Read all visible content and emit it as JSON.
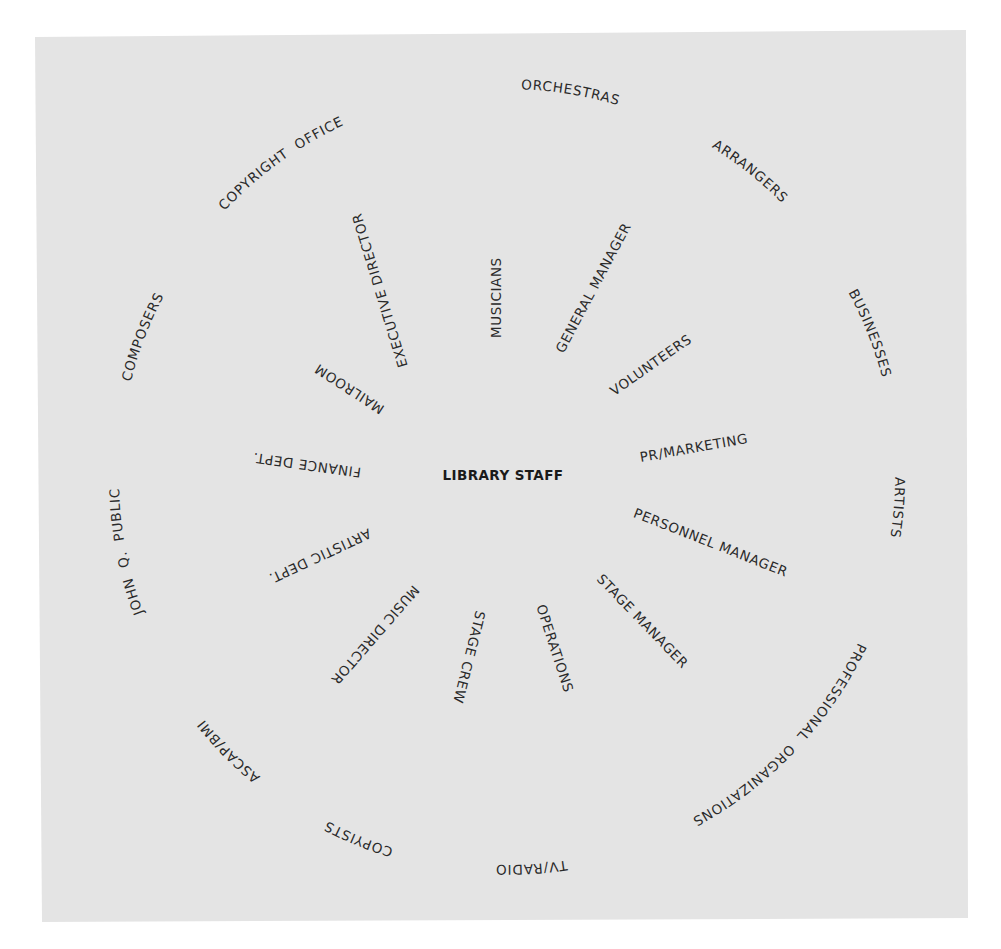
{
  "diagram": {
    "center": {
      "label": "LIBRARY STAFF",
      "x": 503,
      "y": 480
    },
    "panel_color": "#e4e4e4",
    "text_color": "#2a2a2a",
    "inner_ring": [
      {
        "label": "MUSICIANS",
        "x1": 497,
        "y1": 338,
        "angle": -90
      },
      {
        "label": "GENERAL MANAGER",
        "x1": 560,
        "y1": 352,
        "angle": -62
      },
      {
        "label": "VOLUNTEERS",
        "x1": 612,
        "y1": 393,
        "angle": -35
      },
      {
        "label": "PR/MARKETING",
        "x1": 640,
        "y1": 458,
        "angle": -10
      },
      {
        "label": "PERSONNEL MANAGER",
        "x1": 634,
        "y1": 513,
        "angle": 21.5
      },
      {
        "label": "STAGE MANAGER",
        "x1": 599,
        "y1": 577,
        "angle": 46
      },
      {
        "label": "OPERATIONS",
        "x1": 540,
        "y1": 605,
        "angle": 72
      },
      {
        "label": "STAGE CREW",
        "x1": 480,
        "y1": 611,
        "angle": 104
      },
      {
        "label": "MUSIC DIRECTOR",
        "x1": 416,
        "y1": 587,
        "angle": 131
      },
      {
        "label": "ARTISTIC DEPT.",
        "x1": 370,
        "y1": 532,
        "angle": 155
      },
      {
        "label": "FINANCE DEPT.",
        "x1": 361,
        "y1": 472,
        "angle": 188
      },
      {
        "label": "MAILROOM",
        "x1": 383,
        "y1": 410,
        "angle": 213
      },
      {
        "label": "EXECUTIVE DIRECTOR",
        "x1": 404,
        "y1": 367,
        "angle": -107
      }
    ],
    "outer_ring": {
      "cx": 507,
      "cy": 477,
      "r": 388,
      "items": [
        {
          "label": "SISTER  ORCHESTRAS",
          "angle": 4.8
        },
        {
          "label": "ARRANGERS",
          "angle": 38.5
        },
        {
          "label": "BUSINESSES",
          "angle": 68.4
        },
        {
          "label": "ARTISTS",
          "angle": 94.5
        },
        {
          "label": "PROFESSIONAL  ORGANIZATIONS",
          "angle": 133.4
        },
        {
          "label": "TV/RADIO",
          "angle": 176.4
        },
        {
          "label": "COPYISTS",
          "angle": 202.3
        },
        {
          "label": "ASCAP/BMI",
          "angle": 225.4
        },
        {
          "label": "JOHN  Q.  PUBLIC",
          "angle": 258.9
        },
        {
          "label": "COMPOSERS",
          "angle": 291
        },
        {
          "label": "COPYRIGHT  OFFICE",
          "angle": 324.2
        }
      ]
    }
  }
}
